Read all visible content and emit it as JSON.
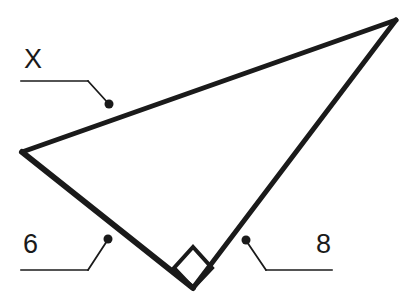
{
  "canvas": {
    "width": 412,
    "height": 300,
    "background_color": "#ffffff",
    "stroke_color": "#1a1a1a"
  },
  "figure": {
    "type": "right-triangle",
    "right_angle_marker": true
  },
  "geometry": {
    "vertices": {
      "left": {
        "x": 22,
        "y": 152
      },
      "top_right": {
        "x": 396,
        "y": 20
      },
      "bottom": {
        "x": 193,
        "y": 288
      }
    },
    "edges": [
      {
        "name": "hypotenuse",
        "from": "left",
        "to": "top_right",
        "label": "X",
        "stroke_width": 5
      },
      {
        "name": "leg-left",
        "from": "left",
        "to": "bottom",
        "label": "6",
        "stroke_width": 6
      },
      {
        "name": "leg-right",
        "from": "bottom",
        "to": "top_right",
        "label": "8",
        "stroke_width": 5
      }
    ],
    "right_angle_square": {
      "at_vertex": "bottom",
      "points": "193,288 174,268 193,247 212,268",
      "stroke_width": 4
    }
  },
  "labels": [
    {
      "id": "label-x",
      "text": "X",
      "text_x": 24,
      "text_y": 68,
      "leader": {
        "horizontal": {
          "x1": 21,
          "y1": 81,
          "x2": 88,
          "y2": 81
        },
        "diagonal": {
          "x1": 88,
          "y1": 81,
          "x2": 108,
          "y2": 103
        },
        "dot": {
          "cx": 109,
          "cy": 104,
          "r": 4.5
        }
      }
    },
    {
      "id": "label-6",
      "text": "6",
      "text_x": 23,
      "text_y": 253,
      "leader": {
        "horizontal": {
          "x1": 21,
          "y1": 270,
          "x2": 88,
          "y2": 270
        },
        "diagonal": {
          "x1": 88,
          "y1": 270,
          "x2": 107,
          "y2": 241
        },
        "dot": {
          "cx": 108,
          "cy": 239,
          "r": 4.5
        }
      }
    },
    {
      "id": "label-8",
      "text": "8",
      "text_x": 316,
      "text_y": 253,
      "leader": {
        "horizontal": {
          "x1": 266,
          "y1": 270,
          "x2": 332,
          "y2": 270
        },
        "diagonal": {
          "x1": 266,
          "y1": 270,
          "x2": 247,
          "y2": 242
        },
        "dot": {
          "cx": 246,
          "cy": 240,
          "r": 4.5
        }
      }
    }
  ]
}
